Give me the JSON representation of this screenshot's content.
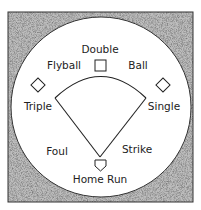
{
  "diagram": {
    "labels": {
      "double": "Double",
      "flyball": "Flyball",
      "ball": "Ball",
      "triple": "Triple",
      "single": "Single",
      "foul": "Foul",
      "strike": "Strike",
      "home_run": "Home Run"
    },
    "colors": {
      "background": "#ffffff",
      "stipple_border": "#a8a8a8",
      "line": "#222222"
    }
  }
}
